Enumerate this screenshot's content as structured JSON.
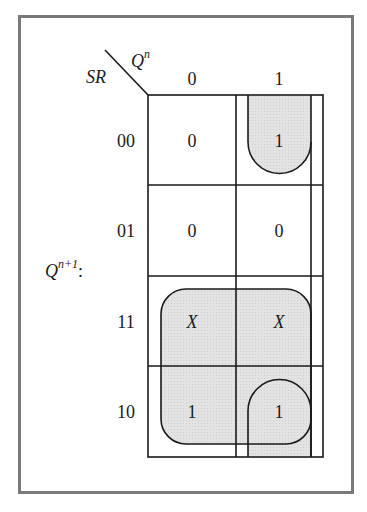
{
  "diagram": {
    "type": "karnaugh-map",
    "output_label": "Q",
    "output_sup": "n+1",
    "output_colon": ":",
    "row_var": "SR",
    "col_var": "Q",
    "col_var_sup": "n",
    "col_headers": [
      "0",
      "1"
    ],
    "row_headers": [
      "00",
      "01",
      "11",
      "10"
    ],
    "cells": [
      [
        "0",
        "1"
      ],
      [
        "0",
        "0"
      ],
      [
        "X",
        "X"
      ],
      [
        "1",
        "1"
      ]
    ],
    "groups": [
      {
        "name": "wrap-around group Q^n=1 rows 10,00",
        "cells": [
          [
            0,
            1
          ],
          [
            3,
            1
          ]
        ]
      },
      {
        "name": "group S rows 11,10",
        "cells": [
          [
            2,
            0
          ],
          [
            2,
            1
          ],
          [
            3,
            0
          ],
          [
            3,
            1
          ]
        ]
      }
    ],
    "colors": {
      "frame": "#7a7a7a",
      "lines": "#1a1a1a",
      "group_fill": "#e0e0e0"
    }
  }
}
